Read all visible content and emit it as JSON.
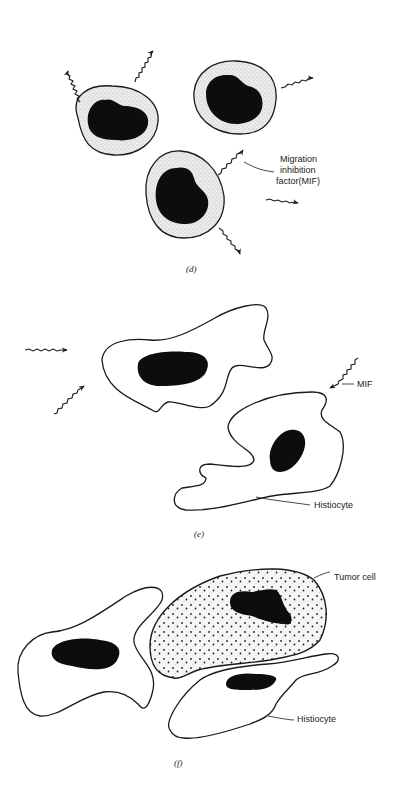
{
  "panels": [
    {
      "id": "d",
      "caption": "(d)",
      "labels": {
        "mif_line1": "Migration",
        "mif_line2": "inhibition",
        "mif_line3": "factor(MIF)"
      },
      "description": "Three stippled lymphocytes with dark nuclei releasing wavy-arrow MIF signals"
    },
    {
      "id": "e",
      "caption": "(e)",
      "labels": {
        "mif": "MIF",
        "histiocyte": "Histiocyte"
      },
      "description": "Two irregular histiocytes receiving wavy-arrow MIF signals"
    },
    {
      "id": "f",
      "caption": "(f)",
      "labels": {
        "tumor_cell": "Tumor cell",
        "histiocyte": "Histiocyte"
      },
      "description": "Histiocytes surrounding a densely stippled tumor cell"
    }
  ],
  "colors": {
    "ink": "#1a1a1a",
    "nucleus": "#0d0d0d",
    "background": "#ffffff",
    "stipple": "#9a9a9a"
  }
}
